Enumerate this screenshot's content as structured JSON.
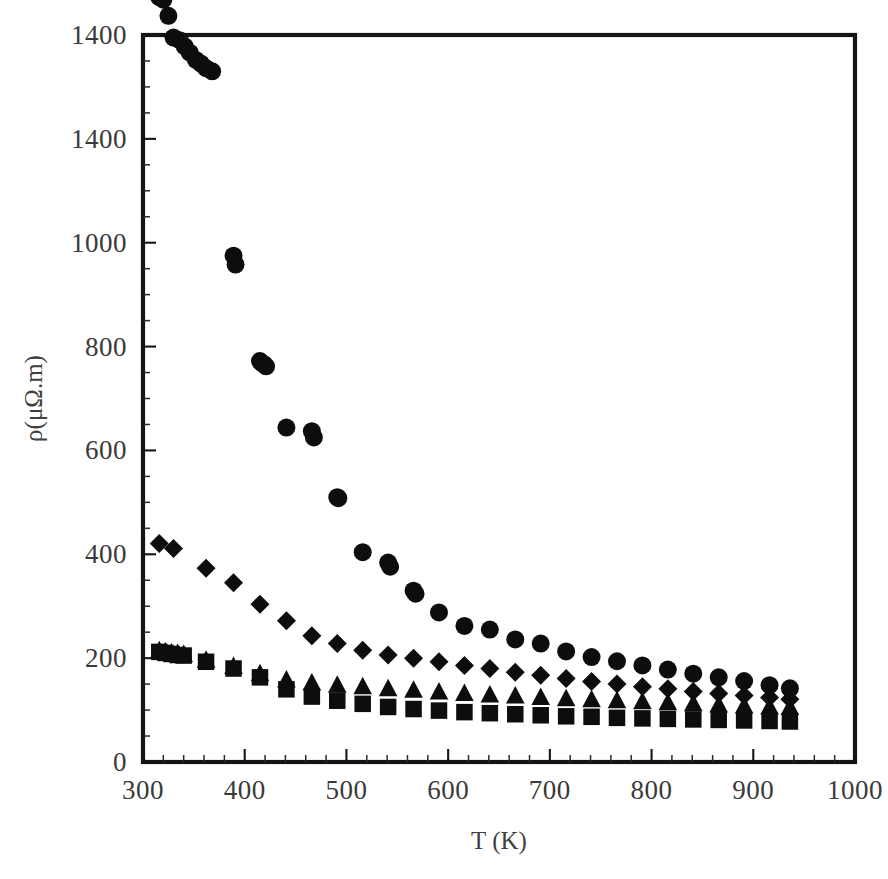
{
  "figure": {
    "background_color": "#ffffff",
    "ink_color": "#0d0d0d",
    "axis_color": "#151515"
  },
  "axes": {
    "x_title": "T (K)",
    "y_title": "ρ(μΩ.m)",
    "x_ticks": [
      "300",
      "400",
      "500",
      "600",
      "700",
      "800",
      "900",
      "1000"
    ],
    "y_ticks": [
      "0",
      "200",
      "400",
      "600",
      "800",
      "1000",
      "1400",
      "1400"
    ],
    "x_minor_per_interval": 5,
    "y_minor_per_interval": 4
  },
  "chart_data": {
    "type": "scatter",
    "title": "",
    "xlabel": "T (K)",
    "ylabel": "ρ(μΩ.m)",
    "xlim": [
      300,
      1000
    ],
    "ylim": [
      0,
      1400
    ],
    "xticks": [
      300,
      400,
      500,
      600,
      700,
      800,
      900,
      1000
    ],
    "yticks": [
      0,
      200,
      400,
      600,
      800,
      1000,
      1200,
      1400
    ],
    "ytick_labels": [
      "0",
      "200",
      "400",
      "600",
      "800",
      "1000",
      "1400",
      "1400"
    ],
    "grid": false,
    "legend": "none",
    "color": "#0d0d0d",
    "series": [
      {
        "name": "circle-series",
        "marker": "circle",
        "x": [
          316,
          320,
          325,
          330,
          336,
          341,
          346,
          352,
          357,
          362,
          368,
          389,
          391,
          415,
          417,
          419,
          421,
          441,
          466,
          468,
          491,
          492,
          516,
          541,
          543,
          566,
          568,
          591,
          616,
          641,
          666,
          691,
          716,
          741,
          766,
          791,
          816,
          841,
          866,
          891,
          916,
          936
        ],
        "y": [
          1473,
          1468,
          1437,
          1395,
          1390,
          1378,
          1366,
          1352,
          1345,
          1336,
          1330,
          975,
          958,
          772,
          768,
          766,
          762,
          644,
          637,
          625,
          510,
          508,
          404,
          384,
          376,
          330,
          324,
          288,
          262,
          255,
          236,
          228,
          213,
          202,
          194,
          186,
          178,
          170,
          163,
          156,
          148,
          142
        ],
        "note": "highest resistivity branch, dense cluster near 320 K"
      },
      {
        "name": "diamond-series",
        "marker": "diamond",
        "x": [
          316,
          330,
          362,
          389,
          415,
          441,
          466,
          491,
          516,
          541,
          566,
          591,
          616,
          641,
          666,
          691,
          716,
          741,
          766,
          791,
          816,
          841,
          866,
          891,
          916,
          936
        ],
        "y": [
          421,
          411,
          373,
          345,
          304,
          272,
          243,
          228,
          215,
          206,
          200,
          193,
          186,
          180,
          173,
          167,
          161,
          155,
          150,
          145,
          141,
          136,
          132,
          128,
          124,
          121
        ],
        "note": "intermediate branch"
      },
      {
        "name": "triangle-series",
        "marker": "triangle",
        "x": [
          316,
          322,
          328,
          334,
          340,
          362,
          389,
          415,
          441,
          466,
          491,
          516,
          541,
          566,
          591,
          616,
          641,
          666,
          691,
          716,
          741,
          766,
          791,
          816,
          841,
          866,
          891,
          916,
          936
        ],
        "y": [
          214,
          212,
          210,
          209,
          207,
          196,
          184,
          170,
          158,
          152,
          148,
          145,
          141,
          138,
          135,
          132,
          129,
          127,
          124,
          122,
          120,
          118,
          116,
          114,
          112,
          110,
          108,
          106,
          105
        ],
        "note": "lower-middle branch, overlaps squares at low T"
      },
      {
        "name": "square-series",
        "marker": "square",
        "x": [
          316,
          322,
          328,
          334,
          340,
          362,
          389,
          415,
          441,
          466,
          491,
          516,
          541,
          566,
          591,
          616,
          641,
          666,
          691,
          716,
          741,
          766,
          791,
          816,
          841,
          866,
          891,
          916,
          936
        ],
        "y": [
          212,
          210,
          208,
          206,
          205,
          193,
          180,
          163,
          140,
          126,
          118,
          112,
          106,
          102,
          99,
          96,
          94,
          92,
          90,
          88,
          87,
          85,
          84,
          83,
          82,
          81,
          80,
          79,
          78
        ],
        "note": "lowest resistivity branch"
      }
    ]
  }
}
